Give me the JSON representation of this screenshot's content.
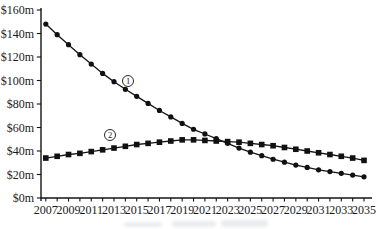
{
  "chart_data": {
    "type": "line",
    "title": "",
    "xlabel": "",
    "ylabel": "",
    "ylim": [
      0,
      160
    ],
    "y_tick_step": 20,
    "grid": false,
    "legend_position": "inline-annotations",
    "x": [
      2007,
      2008,
      2009,
      2010,
      2011,
      2012,
      2013,
      2014,
      2015,
      2016,
      2017,
      2018,
      2019,
      2020,
      2021,
      2022,
      2023,
      2024,
      2025,
      2026,
      2027,
      2028,
      2029,
      2030,
      2031,
      2032,
      2033,
      2034,
      2035
    ],
    "x_tick_labels": [
      "2007",
      "2009",
      "2011",
      "2013",
      "2015",
      "2017",
      "2019",
      "2021",
      "2023",
      "2025",
      "2027",
      "2029",
      "2031",
      "2033",
      "2035"
    ],
    "y_tick_labels": [
      "$0m",
      "$20m",
      "$40m",
      "$60m",
      "$80m",
      "$100m",
      "$120m",
      "$140m",
      "$160m"
    ],
    "series": [
      {
        "name": "series-1",
        "label": "1",
        "marker": "circle",
        "values": [
          148,
          139,
          130.5,
          122,
          114,
          106,
          99,
          92.5,
          86.5,
          80.5,
          74.5,
          69,
          63.5,
          58.5,
          54.5,
          50.5,
          46.5,
          42.5,
          39,
          36,
          33,
          30.5,
          28,
          26,
          24,
          22.5,
          21,
          19.5,
          18
        ]
      },
      {
        "name": "series-2",
        "label": "2",
        "marker": "square",
        "values": [
          34,
          35.5,
          37,
          38,
          39.5,
          41,
          42.5,
          44,
          45.5,
          46.5,
          47.5,
          48.5,
          49.5,
          49.5,
          49,
          48.5,
          48,
          47.5,
          46.5,
          45.5,
          44.5,
          43,
          41.5,
          40,
          38.5,
          37,
          35.5,
          34,
          32
        ]
      }
    ],
    "colors": {
      "line": "#141414",
      "marker": "#111111",
      "text": "#1a1a1a",
      "background": "#ffffff"
    }
  }
}
